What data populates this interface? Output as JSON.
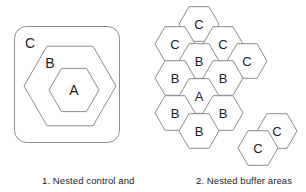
{
  "figure": {
    "background_color": "#ffffff",
    "stroke_color": "#8c8c8c",
    "text_color": "#1c1c1c"
  },
  "panels": [
    {
      "id": "nested-control",
      "caption": "1. Nested control and",
      "type": "nested-outline",
      "shapes": [
        {
          "label": "C",
          "shape": "rounded-rectangle",
          "x": 14,
          "y": 26,
          "width": 105,
          "height": 116,
          "radius": 12,
          "label_x": 30,
          "label_y": 43
        },
        {
          "label": "B",
          "shape": "hexagon-flat-top",
          "cx": 70,
          "cy": 86,
          "size": 46,
          "label_x": 50,
          "label_y": 63
        },
        {
          "label": "A",
          "shape": "hexagon-flat-top",
          "cx": 74,
          "cy": 90,
          "size": 25,
          "label_x": 74,
          "label_y": 90
        }
      ]
    },
    {
      "id": "nested-buffer",
      "caption": "2. Nested buffer areas",
      "type": "hex-grid",
      "hex_size": 20,
      "cells": [
        {
          "label": "C",
          "cx": 199,
          "cy": 24
        },
        {
          "label": "C",
          "cx": 175,
          "cy": 44
        },
        {
          "label": "C",
          "cx": 223,
          "cy": 44
        },
        {
          "label": "B",
          "cx": 199,
          "cy": 61
        },
        {
          "label": "C",
          "cx": 247,
          "cy": 61
        },
        {
          "label": "B",
          "cx": 175,
          "cy": 78
        },
        {
          "label": "B",
          "cx": 223,
          "cy": 78
        },
        {
          "label": "A",
          "cx": 199,
          "cy": 96
        },
        {
          "label": "B",
          "cx": 175,
          "cy": 113
        },
        {
          "label": "B",
          "cx": 223,
          "cy": 113
        },
        {
          "label": "B",
          "cx": 199,
          "cy": 131
        },
        {
          "label": "C",
          "cx": 277,
          "cy": 131
        },
        {
          "label": "C",
          "cx": 258,
          "cy": 148
        }
      ]
    }
  ]
}
